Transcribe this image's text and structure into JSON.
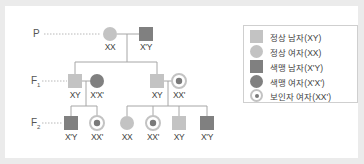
{
  "colors": {
    "normal": "#c3c3c3",
    "colorblind": "#808080",
    "carrier_ring": "#c3c3c3",
    "carrier_center": "#7a7a7a",
    "line": "#a6a6a6",
    "dotted": "#b8b8b8",
    "frame": "#ebebeb"
  },
  "generations": [
    {
      "label": "P",
      "sub": ""
    },
    {
      "label": "F",
      "sub": "1"
    },
    {
      "label": "F",
      "sub": "2"
    }
  ],
  "individuals": {
    "p": [
      {
        "shape": "circle",
        "status": "normal",
        "genotype": "XX"
      },
      {
        "shape": "square",
        "status": "colorblind",
        "genotype": "X'Y"
      }
    ],
    "f1": [
      {
        "shape": "square",
        "status": "normal",
        "genotype": "XY"
      },
      {
        "shape": "circle",
        "status": "colorblind",
        "genotype": "X'X'"
      },
      {
        "shape": "square",
        "status": "normal",
        "genotype": "XY"
      },
      {
        "shape": "circle",
        "status": "carrier",
        "genotype": "XX'"
      }
    ],
    "f2": [
      {
        "shape": "square",
        "status": "colorblind",
        "genotype": "X'Y"
      },
      {
        "shape": "circle",
        "status": "carrier",
        "genotype": "XX'"
      },
      {
        "shape": "circle",
        "status": "normal",
        "genotype": "XX"
      },
      {
        "shape": "circle",
        "status": "carrier",
        "genotype": "XX'"
      },
      {
        "shape": "square",
        "status": "normal",
        "genotype": "XY"
      },
      {
        "shape": "square",
        "status": "colorblind",
        "genotype": "X'Y"
      }
    ]
  },
  "legend": [
    {
      "symbol": "normal-male",
      "text": "정상 남자(XY)"
    },
    {
      "symbol": "normal-female",
      "text": "정상 여자(XX)"
    },
    {
      "symbol": "colorblind-male",
      "text": "색맹 남자(X'Y)"
    },
    {
      "symbol": "colorblind-female",
      "text": "색맹 여자(X'X')"
    },
    {
      "symbol": "carrier-female",
      "text": "보인자 여자(XX')"
    }
  ]
}
